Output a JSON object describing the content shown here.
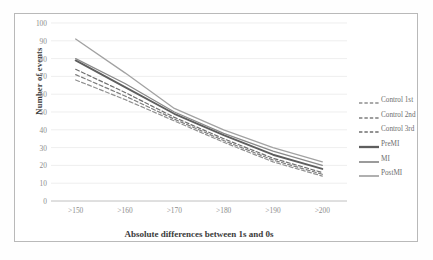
{
  "chart_data": {
    "type": "line",
    "title": "",
    "xlabel": "Absolute differences between 1s and 0s",
    "ylabel": "Number of events",
    "categories": [
      ">150",
      ">160",
      ">170",
      ">180",
      ">190",
      ">200"
    ],
    "ylim": [
      0,
      100
    ],
    "ytick_step": 10,
    "yticks": [
      "100",
      "90",
      "80",
      "70",
      "60",
      "50",
      "40",
      "30",
      "20",
      "10",
      "0"
    ],
    "grid": "horizontal",
    "legend_position": "right",
    "series": [
      {
        "name": "Control 1st",
        "style": "dashed",
        "color": "#8f8f8f",
        "width": 1.2,
        "values": [
          68,
          57,
          45,
          33,
          22,
          14
        ]
      },
      {
        "name": "Control 2nd",
        "style": "dashed",
        "color": "#7d7d7d",
        "width": 1.2,
        "values": [
          71,
          59,
          46,
          34,
          23,
          15
        ]
      },
      {
        "name": "Control 3rd",
        "style": "dashed",
        "color": "#6f6f6f",
        "width": 1.2,
        "values": [
          74,
          61,
          47,
          35,
          24,
          16
        ]
      },
      {
        "name": "PreMI",
        "style": "solid",
        "color": "#5e5e5e",
        "width": 1.9,
        "values": [
          79,
          64,
          49,
          37,
          26,
          18
        ]
      },
      {
        "name": "MI",
        "style": "solid",
        "color": "#8a8a8a",
        "width": 1.3,
        "values": [
          80,
          66,
          50,
          38,
          28,
          20
        ]
      },
      {
        "name": "PostMI",
        "style": "solid",
        "color": "#a2a2a2",
        "width": 1.3,
        "values": [
          91,
          72,
          52,
          40,
          30,
          22
        ]
      }
    ]
  }
}
